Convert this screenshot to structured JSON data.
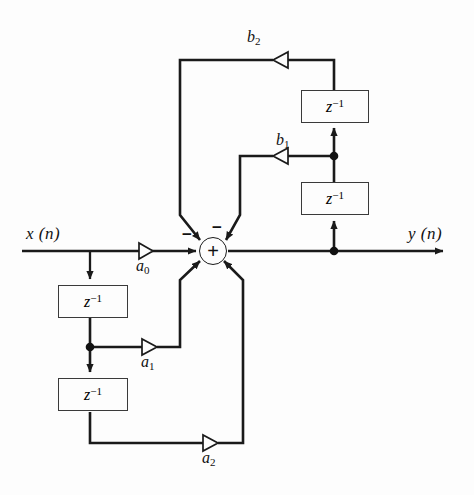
{
  "figure": {
    "kind": "signal-flow-diagram",
    "background_color": "#fdfdfd",
    "line_color": "#1a1a1a",
    "box_border_color": "#3a3a3a"
  },
  "labels": {
    "input": "x (n)",
    "output": "y (n)",
    "coefficients": {
      "a0": "a",
      "a0_sub": "0",
      "a1": "a",
      "a1_sub": "1",
      "a2": "a",
      "a2_sub": "2",
      "b1": "b",
      "b1_sub": "1",
      "b2": "b",
      "b2_sub": "2"
    },
    "delay": {
      "base": "z",
      "exponent": "−1"
    },
    "adder_symbol": "+",
    "minus_top_left": "−",
    "minus_top_right": "−"
  },
  "delay_blocks": [
    {
      "id": "feedforward-delay-1",
      "text_base": "z",
      "text_exp": "−1"
    },
    {
      "id": "feedforward-delay-2",
      "text_base": "z",
      "text_exp": "−1"
    },
    {
      "id": "feedback-delay-1",
      "text_base": "z",
      "text_exp": "−1"
    },
    {
      "id": "feedback-delay-2",
      "text_base": "z",
      "text_exp": "−1"
    }
  ],
  "gains": [
    {
      "id": "gain-a0",
      "label": "a",
      "sub": "0",
      "direction": "right"
    },
    {
      "id": "gain-a1",
      "label": "a",
      "sub": "1",
      "direction": "right"
    },
    {
      "id": "gain-a2",
      "label": "a",
      "sub": "2",
      "direction": "right"
    },
    {
      "id": "gain-b1",
      "label": "b",
      "sub": "1",
      "direction": "left"
    },
    {
      "id": "gain-b2",
      "label": "b",
      "sub": "2",
      "direction": "left"
    }
  ]
}
